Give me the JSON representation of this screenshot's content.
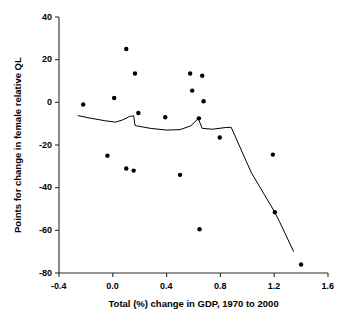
{
  "chart_data": {
    "type": "scatter",
    "title": "",
    "xlabel": "Total (%) change in GDP, 1970 to 2000",
    "ylabel": "Points for change in female relative QL",
    "xlim": [
      -0.4,
      1.6
    ],
    "ylim": [
      -80,
      40
    ],
    "xticks": [
      "-0.4",
      "0.0",
      "0.4",
      "0.8",
      "1.2",
      "1.6"
    ],
    "xtick_values": [
      -0.4,
      0.0,
      0.4,
      0.8,
      1.2,
      1.6
    ],
    "yticks": [
      "40",
      "20",
      "0",
      "-20",
      "-40",
      "-60",
      "-80"
    ],
    "ytick_values": [
      40,
      20,
      0,
      -20,
      -40,
      -60,
      -80
    ],
    "grid": false,
    "legend": null,
    "marker_color": "#000000",
    "line_color": "#000000",
    "points": [
      {
        "x": -0.22,
        "y": -1.0
      },
      {
        "x": -0.04,
        "y": -25.0
      },
      {
        "x": 0.01,
        "y": 2.0
      },
      {
        "x": 0.1,
        "y": 25.0
      },
      {
        "x": 0.1,
        "y": -31.0
      },
      {
        "x": 0.155,
        "y": -32.0
      },
      {
        "x": 0.165,
        "y": 13.5
      },
      {
        "x": 0.19,
        "y": -5.0
      },
      {
        "x": 0.39,
        "y": -7.0
      },
      {
        "x": 0.5,
        "y": -34.0
      },
      {
        "x": 0.575,
        "y": 13.5
      },
      {
        "x": 0.59,
        "y": 5.5
      },
      {
        "x": 0.64,
        "y": -7.5
      },
      {
        "x": 0.645,
        "y": -59.5
      },
      {
        "x": 0.665,
        "y": 12.5
      },
      {
        "x": 0.675,
        "y": 0.5
      },
      {
        "x": 0.795,
        "y": -16.5
      },
      {
        "x": 1.19,
        "y": -24.5
      },
      {
        "x": 1.205,
        "y": -51.5
      },
      {
        "x": 1.4,
        "y": -76.0
      }
    ],
    "trend_line": [
      {
        "x": -0.26,
        "y": -6.2
      },
      {
        "x": -0.16,
        "y": -7.5
      },
      {
        "x": -0.06,
        "y": -8.6
      },
      {
        "x": 0.02,
        "y": -9.3
      },
      {
        "x": 0.075,
        "y": -8.2
      },
      {
        "x": 0.125,
        "y": -6.6
      },
      {
        "x": 0.155,
        "y": -6.3
      },
      {
        "x": 0.165,
        "y": -10.8
      },
      {
        "x": 0.175,
        "y": -11.0
      },
      {
        "x": 0.28,
        "y": -12.2
      },
      {
        "x": 0.4,
        "y": -13.0
      },
      {
        "x": 0.5,
        "y": -12.8
      },
      {
        "x": 0.58,
        "y": -11.0
      },
      {
        "x": 0.635,
        "y": -7.6
      },
      {
        "x": 0.665,
        "y": -12.2
      },
      {
        "x": 0.74,
        "y": -12.6
      },
      {
        "x": 0.84,
        "y": -11.8
      },
      {
        "x": 0.88,
        "y": -11.7
      },
      {
        "x": 1.03,
        "y": -33.0
      },
      {
        "x": 1.2,
        "y": -51.0
      },
      {
        "x": 1.24,
        "y": -56.0
      },
      {
        "x": 1.345,
        "y": -70.0
      }
    ]
  }
}
